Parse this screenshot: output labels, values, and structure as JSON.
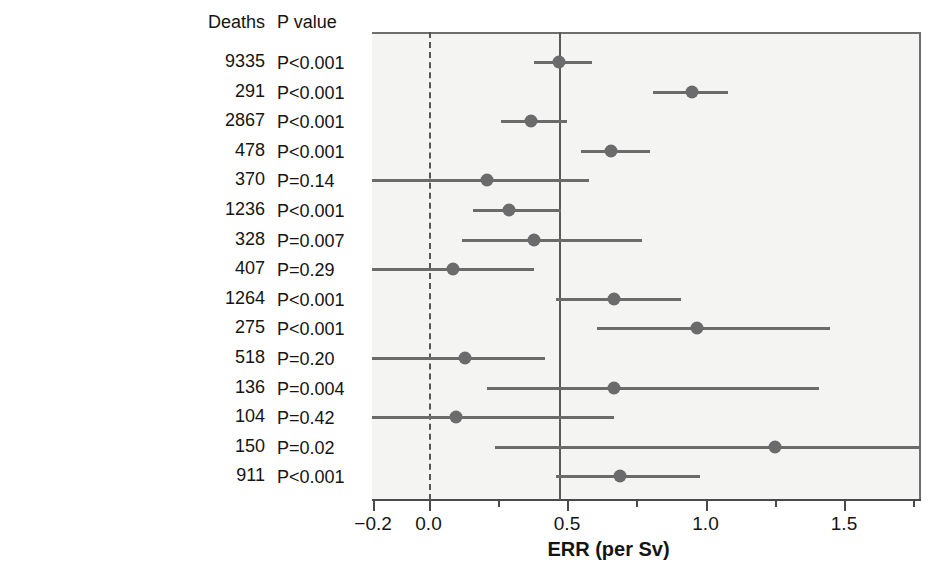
{
  "table": {
    "headers": {
      "label": "",
      "deaths": "Deaths",
      "pvalue": "P value"
    }
  },
  "axis": {
    "xlabel": "ERR (per Sv)",
    "ticks": [
      {
        "value": -0.2,
        "label": "−0.2"
      },
      {
        "value": 0.0,
        "label": "0.0"
      },
      {
        "value": 0.25,
        "label": ""
      },
      {
        "value": 0.5,
        "label": "0.5"
      },
      {
        "value": 0.75,
        "label": ""
      },
      {
        "value": 1.0,
        "label": "1.0"
      },
      {
        "value": 1.25,
        "label": ""
      },
      {
        "value": 1.5,
        "label": "1.5"
      },
      {
        "value": 1.75,
        "label": ""
      }
    ]
  },
  "chart_data": {
    "type": "bar",
    "plot_kind": "forest",
    "title": "",
    "xlabel": "ERR (per Sv)",
    "ylabel": "",
    "xlim": [
      -0.2,
      1.78
    ],
    "grid": false,
    "legend": "none",
    "zero_line": 0.0,
    "reference_line": 0.47,
    "columns": [
      "Site",
      "Deaths",
      "P value",
      "ERR",
      "CI low",
      "CI high"
    ],
    "categories": [
      "All solid cancers",
      "Esophagus",
      "Stomach",
      "Colon",
      "Rectum",
      "Liver",
      "Gall bladder",
      "Pancreas",
      "Lung",
      "Breast",
      "Uterus",
      "Ovary",
      "Prostate",
      "Bladder",
      "Other solid"
    ],
    "values": [
      0.47,
      0.95,
      0.37,
      0.66,
      0.21,
      0.29,
      0.38,
      0.09,
      0.67,
      0.97,
      0.13,
      0.67,
      0.1,
      1.25,
      0.69
    ],
    "ci_low": [
      0.38,
      0.81,
      0.26,
      0.55,
      -0.25,
      0.16,
      0.12,
      -0.24,
      0.46,
      0.61,
      -0.21,
      0.21,
      -0.22,
      0.24,
      0.46
    ],
    "ci_high": [
      0.59,
      1.08,
      0.5,
      0.8,
      0.58,
      0.48,
      0.77,
      0.38,
      0.91,
      1.45,
      0.42,
      1.41,
      0.67,
      1.85,
      0.98
    ],
    "rows": [
      {
        "site": "All solid cancers",
        "deaths": "9335",
        "pvalue": "P<0.001",
        "err": 0.47,
        "ci_low": 0.38,
        "ci_high": 0.59,
        "clip_low": false,
        "clip_high": false
      },
      {
        "site": "Esophagus",
        "deaths": "291",
        "pvalue": "P<0.001",
        "err": 0.95,
        "ci_low": 0.81,
        "ci_high": 1.08,
        "clip_low": false,
        "clip_high": false
      },
      {
        "site": "Stomach",
        "deaths": "2867",
        "pvalue": "P<0.001",
        "err": 0.37,
        "ci_low": 0.26,
        "ci_high": 0.5,
        "clip_low": false,
        "clip_high": false
      },
      {
        "site": "Colon",
        "deaths": "478",
        "pvalue": "P<0.001",
        "err": 0.66,
        "ci_low": 0.55,
        "ci_high": 0.8,
        "clip_low": false,
        "clip_high": false
      },
      {
        "site": "Rectum",
        "deaths": "370",
        "pvalue": "P=0.14",
        "err": 0.21,
        "ci_low": -0.25,
        "ci_high": 0.58,
        "clip_low": true,
        "clip_high": false
      },
      {
        "site": "Liver",
        "deaths": "1236",
        "pvalue": "P<0.001",
        "err": 0.29,
        "ci_low": 0.16,
        "ci_high": 0.48,
        "clip_low": false,
        "clip_high": false
      },
      {
        "site": "Gall bladder",
        "deaths": "328",
        "pvalue": "P=0.007",
        "err": 0.38,
        "ci_low": 0.12,
        "ci_high": 0.77,
        "clip_low": false,
        "clip_high": false
      },
      {
        "site": "Pancreas",
        "deaths": "407",
        "pvalue": "P=0.29",
        "err": 0.09,
        "ci_low": -0.25,
        "ci_high": 0.38,
        "clip_low": true,
        "clip_high": false
      },
      {
        "site": "Lung",
        "deaths": "1264",
        "pvalue": "P<0.001",
        "err": 0.67,
        "ci_low": 0.46,
        "ci_high": 0.91,
        "clip_low": false,
        "clip_high": false
      },
      {
        "site": "Breast",
        "deaths": "275",
        "pvalue": "P<0.001",
        "err": 0.97,
        "ci_low": 0.61,
        "ci_high": 1.45,
        "clip_low": false,
        "clip_high": false
      },
      {
        "site": "Uterus",
        "deaths": "518",
        "pvalue": "P=0.20",
        "err": 0.13,
        "ci_low": -0.25,
        "ci_high": 0.42,
        "clip_low": true,
        "clip_high": false
      },
      {
        "site": "Ovary",
        "deaths": "136",
        "pvalue": "P=0.004",
        "err": 0.67,
        "ci_low": 0.21,
        "ci_high": 1.41,
        "clip_low": false,
        "clip_high": false
      },
      {
        "site": "Prostate",
        "deaths": "104",
        "pvalue": "P=0.42",
        "err": 0.1,
        "ci_low": -0.25,
        "ci_high": 0.67,
        "clip_low": true,
        "clip_high": false
      },
      {
        "site": "Bladder",
        "deaths": "150",
        "pvalue": "P=0.02",
        "err": 1.25,
        "ci_low": 0.24,
        "ci_high": 1.85,
        "clip_low": false,
        "clip_high": true
      },
      {
        "site": "Other solid",
        "deaths": "911",
        "pvalue": "P<0.001",
        "err": 0.69,
        "ci_low": 0.46,
        "ci_high": 0.98,
        "clip_low": false,
        "clip_high": false
      }
    ]
  },
  "style": {
    "marker_color": "#6b6b6b",
    "line_color": "#6b6b6b",
    "plot_bg": "#f4f4f3",
    "text_color": "#141414"
  }
}
